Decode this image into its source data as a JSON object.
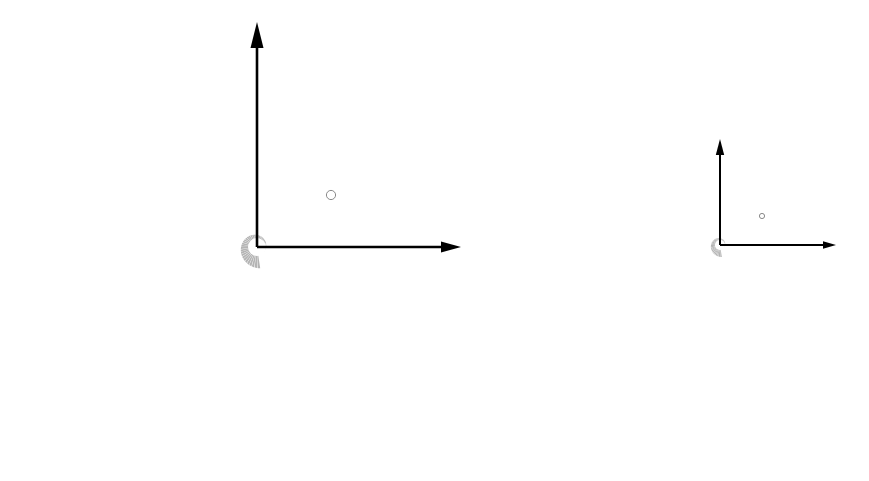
{
  "figure": {
    "background_color": "#ffffff",
    "shell_fill_color": "#b4b4b4",
    "shell_fill_color_faint": "#d2d2d2",
    "axis_color": "#000000",
    "marker_fill_color": "#ffffff",
    "marker_stroke_color": "#8a8a8a",
    "canvas": {
      "width": 869,
      "height": 481
    }
  },
  "panels": [
    {
      "id": "left-shell",
      "label": "large specimen",
      "center": {
        "x": 257,
        "y": 247
      },
      "scale": 1.0,
      "spiral": {
        "type": "logarithmic",
        "a": 3.05,
        "b": 0.1755,
        "theta_start_deg": -75,
        "theta_end_deg": 640,
        "septa_count": 86,
        "septa_gap_deg": 1.45,
        "whorl_inner_ratio": 0.205,
        "umbilicus_radius": 9
      },
      "axes": {
        "origin": {
          "x": 257,
          "y": 247
        },
        "vertical": {
          "x1": 257,
          "y1": 247,
          "x2": 257,
          "y2": 22,
          "arrow": "up",
          "arrow_len": 26,
          "arrow_half_width": 6.5,
          "stroke_width": 2.6
        },
        "horizontal": {
          "x1": 257,
          "y1": 247,
          "x2": 461,
          "y2": 247,
          "arrow": "right",
          "arrow_len": 20,
          "arrow_half_width": 5.5,
          "stroke_width": 2.6
        }
      },
      "marker": {
        "x": 331,
        "y": 195,
        "radius": 4.6,
        "name": "protoconch-marker"
      }
    },
    {
      "id": "right-shell",
      "label": "small specimen",
      "center": {
        "x": 720,
        "y": 245
      },
      "scale": 0.565,
      "spiral": {
        "type": "logarithmic",
        "a": 3.05,
        "b": 0.1755,
        "theta_start_deg": -75,
        "theta_end_deg": 640,
        "septa_count": 86,
        "septa_gap_deg": 1.45,
        "whorl_inner_ratio": 0.205,
        "umbilicus_radius": 9
      },
      "axes": {
        "origin": {
          "x": 720,
          "y": 245
        },
        "vertical": {
          "x1": 720,
          "y1": 245,
          "x2": 720,
          "y2": 139,
          "arrow": "up",
          "arrow_len": 16,
          "arrow_half_width": 4.2,
          "stroke_width": 2.0
        },
        "horizontal": {
          "x1": 720,
          "y1": 245,
          "x2": 836,
          "y2": 245,
          "arrow": "right",
          "arrow_len": 13,
          "arrow_half_width": 3.8,
          "stroke_width": 2.0
        }
      },
      "marker": {
        "x": 762,
        "y": 216,
        "radius": 2.6,
        "name": "protoconch-marker"
      }
    }
  ],
  "chart_data": {
    "type": "scatter",
    "subtitle": "",
    "xlabel": "",
    "ylabel": "",
    "grid": false,
    "legend": null,
    "annotations": [
      "white circular marker near inner whorl of each specimen",
      "coordinate axes with arrowheads at origin of each specimen"
    ],
    "series": [
      {
        "name": "large specimen spiral",
        "growth_model": "r = a * exp(b * theta)",
        "a": 3.05,
        "b": 0.1755,
        "theta_range_deg": [
          -75,
          640
        ],
        "septa_count": 86,
        "center_xy": [
          257,
          247
        ],
        "outer_radius_px": 232
      },
      {
        "name": "small specimen spiral",
        "growth_model": "r = a * exp(b * theta)",
        "a": 1.72,
        "b": 0.1755,
        "theta_range_deg": [
          -75,
          640
        ],
        "septa_count": 86,
        "center_xy": [
          720,
          245
        ],
        "outer_radius_px": 131
      }
    ]
  }
}
